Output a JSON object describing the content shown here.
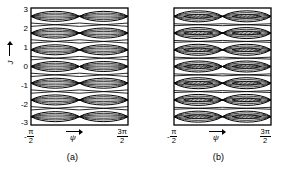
{
  "figure": {
    "title": "",
    "panels": [
      {
        "id": "a",
        "caption": "(a)",
        "xaxis": {
          "label": "ψ",
          "ticks": [
            {
              "neg": "-",
              "num": "π",
              "den": "2",
              "value": -1.5707963
            },
            {
              "neg": "",
              "num": "3π",
              "den": "2",
              "value": 4.712389
            }
          ],
          "range": [
            -1.5707963,
            4.712389
          ]
        },
        "yaxis": {
          "label": "J",
          "ticks": [
            "3",
            "2",
            "1",
            "0",
            "-1",
            "-2",
            "-3"
          ],
          "range": [
            -3.5,
            3.5
          ]
        },
        "content": "nested-lens-bands"
      },
      {
        "id": "b",
        "caption": "(b)",
        "xaxis": {
          "label": "ψ",
          "ticks": [
            {
              "neg": "-",
              "num": "π",
              "den": "2",
              "value": -1.5707963
            },
            {
              "neg": "",
              "num": "3π",
              "den": "2",
              "value": 4.712389
            }
          ],
          "range": [
            -1.5707963,
            4.712389
          ]
        },
        "yaxis": {
          "label": "J",
          "ticks": [
            "3",
            "2",
            "1",
            "0",
            "-1",
            "-2",
            "-3"
          ],
          "range": [
            -3.5,
            3.5
          ]
        },
        "content": "nested-lens-bands-with-hatched-core"
      }
    ],
    "colors": {
      "line": "#000000",
      "background": "#ffffff",
      "hatch": "#000000"
    }
  },
  "chart_data": {
    "type": "line",
    "title": "",
    "xlabel": "ψ",
    "ylabel": "J",
    "xlim": [
      -1.5707963,
      4.712389
    ],
    "ylim": [
      -3.5,
      3.5
    ],
    "xticks": [
      -1.5707963,
      4.712389
    ],
    "xticklabels": [
      "-π/2",
      "3π/2"
    ],
    "yticks": [
      3,
      2,
      1,
      0,
      -1,
      -2,
      -3
    ],
    "yticklabels": [
      "3",
      "2",
      "1",
      "0",
      "-1",
      "-2",
      "-3"
    ],
    "grid": false,
    "legend": null,
    "panels": [
      {
        "name": "(a)",
        "description": "Seven resonance bands centred on integer J = 3,2,1,0,-1,-2,-3. Each band contains nested lens (eye) shaped separatrix contours; the lenses pinch to cusp points at ψ = -π/2, π/2 and 3π/2, giving two lens cells per band across the ψ range.",
        "band_centers": [
          3,
          2,
          1,
          0,
          -1,
          -2,
          -3
        ],
        "lens_nodes_psi": [
          -1.5707963,
          1.5707963,
          4.712389
        ],
        "lens_half_heights": [
          0.4,
          0.26,
          0.13
        ],
        "cells_per_band": 2,
        "contours_per_cell": 3,
        "hatched": false
      },
      {
        "name": "(b)",
        "description": "Same seven bands as (a) but each cell additionally contains a narrow hatched (diagonally shaded) inner lens marking a chaotic/overlap layer; outer lens contours cross between adjacent bands forming a lattice.",
        "band_centers": [
          3,
          2,
          1,
          0,
          -1,
          -2,
          -3
        ],
        "lens_nodes_psi": [
          -1.5707963,
          1.5707963,
          4.712389
        ],
        "lens_half_heights": [
          0.44,
          0.3,
          0.16
        ],
        "cells_per_band": 2,
        "contours_per_cell": 3,
        "hatched": true,
        "hatch_lens_half_height": 0.13,
        "hatch_lens_half_width_frac": 0.3
      }
    ]
  }
}
